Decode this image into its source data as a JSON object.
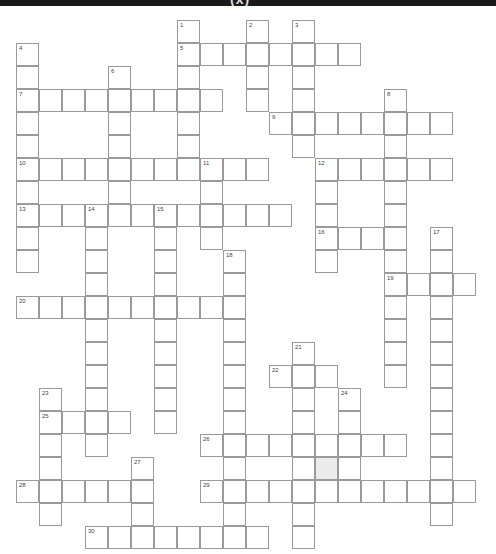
{
  "header": {
    "title": "(x)"
  },
  "grid": {
    "origin_x": 16,
    "origin_y": 20,
    "cell_size": 23,
    "border_color": "#9a9a9a",
    "shaded_color": "#ececec",
    "shaded_cells": [
      {
        "row": 19,
        "col": 13
      }
    ]
  },
  "across": [
    {
      "number": 5,
      "row": 1,
      "col": 7,
      "length": 8
    },
    {
      "number": 7,
      "row": 3,
      "col": 0,
      "length": 9
    },
    {
      "number": 9,
      "row": 4,
      "col": 11,
      "length": 8
    },
    {
      "number": 10,
      "row": 6,
      "col": 0,
      "length": 11
    },
    {
      "number": 12,
      "row": 6,
      "col": 13,
      "length": 6
    },
    {
      "number": 13,
      "row": 8,
      "col": 0,
      "length": 12
    },
    {
      "number": 16,
      "row": 9,
      "col": 13,
      "length": 4
    },
    {
      "number": 19,
      "row": 11,
      "col": 16,
      "length": 4
    },
    {
      "number": 20,
      "row": 12,
      "col": 0,
      "length": 10
    },
    {
      "number": 22,
      "row": 15,
      "col": 11,
      "length": 3
    },
    {
      "number": 25,
      "row": 17,
      "col": 1,
      "length": 4
    },
    {
      "number": 26,
      "row": 18,
      "col": 8,
      "length": 9
    },
    {
      "number": 28,
      "row": 20,
      "col": 0,
      "length": 6
    },
    {
      "number": 29,
      "row": 20,
      "col": 8,
      "length": 12
    },
    {
      "number": 30,
      "row": 22,
      "col": 3,
      "length": 8
    }
  ],
  "down": [
    {
      "number": 1,
      "row": 0,
      "col": 7,
      "length": 7
    },
    {
      "number": 2,
      "row": 0,
      "col": 10,
      "length": 4
    },
    {
      "number": 3,
      "row": 0,
      "col": 12,
      "length": 6
    },
    {
      "number": 4,
      "row": 1,
      "col": 0,
      "length": 10
    },
    {
      "number": 6,
      "row": 2,
      "col": 4,
      "length": 7
    },
    {
      "number": 8,
      "row": 3,
      "col": 16,
      "length": 13
    },
    {
      "number": 11,
      "row": 6,
      "col": 8,
      "length": 4
    },
    {
      "number": 12,
      "row": 6,
      "col": 13,
      "length": 5
    },
    {
      "number": 14,
      "row": 8,
      "col": 3,
      "length": 11
    },
    {
      "number": 15,
      "row": 8,
      "col": 6,
      "length": 10
    },
    {
      "number": 17,
      "row": 9,
      "col": 18,
      "length": 13
    },
    {
      "number": 18,
      "row": 10,
      "col": 9,
      "length": 13
    },
    {
      "number": 21,
      "row": 14,
      "col": 12,
      "length": 9
    },
    {
      "number": 23,
      "row": 16,
      "col": 1,
      "length": 6
    },
    {
      "number": 24,
      "row": 16,
      "col": 14,
      "length": 4
    },
    {
      "number": 27,
      "row": 19,
      "col": 5,
      "length": 4
    }
  ]
}
